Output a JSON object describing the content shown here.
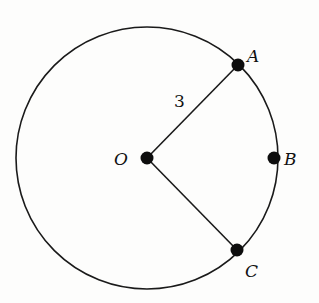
{
  "diagram": {
    "type": "circle-sector",
    "circle": {
      "center_label": "O",
      "cx": 147,
      "cy": 158,
      "r": 131
    },
    "points": [
      {
        "id": "O",
        "label": "O",
        "x": 147,
        "y": 158,
        "label_x": 115,
        "label_y": 165
      },
      {
        "id": "A",
        "label": "A",
        "x": 238,
        "y": 65,
        "label_x": 247,
        "label_y": 62
      },
      {
        "id": "B",
        "label": "B",
        "x": 274,
        "y": 158,
        "label_x": 284,
        "label_y": 165
      },
      {
        "id": "C",
        "label": "C",
        "x": 237,
        "y": 250,
        "label_x": 245,
        "label_y": 276
      }
    ],
    "segments": [
      {
        "from": "O",
        "to": "A",
        "label": "3",
        "label_x": 174,
        "label_y": 107
      },
      {
        "from": "O",
        "to": "C"
      }
    ],
    "radius_label": "3",
    "colors": {
      "stroke": "#1a1a1a",
      "point": "#0d0d0d",
      "background": "#fdfdfc"
    }
  }
}
